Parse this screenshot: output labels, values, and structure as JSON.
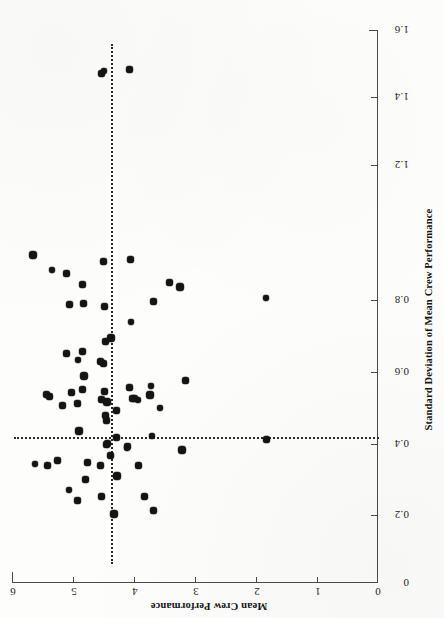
{
  "figure": {
    "orientation": "rotated-90-ccw-scan",
    "background_color": "#fdfdfc",
    "marker_color": "#141414",
    "axis_color": "#4a4a4a",
    "refline_color": "#2a2a2a"
  },
  "chart_data": {
    "type": "scatter",
    "title": "",
    "xlabel": "Standard Deviation of Mean Crew Performance",
    "ylabel": "Mean Crew Performance",
    "xlim": [
      0,
      1.6
    ],
    "ylim": [
      0,
      6
    ],
    "xticks": [
      0,
      0.2,
      0.4,
      0.6,
      0.8,
      1.2,
      1.4,
      1.6
    ],
    "xtick_labels": [
      "0",
      "0.2",
      "0.4",
      "0.6",
      "0.8",
      "1.2",
      "1.4",
      "1.6"
    ],
    "yticks": [
      0,
      1,
      2,
      3,
      4,
      5,
      6
    ],
    "ytick_labels": [
      "0",
      "1",
      "2",
      "3",
      "4",
      "5",
      "6"
    ],
    "grid": false,
    "legend": null,
    "reference_lines": [
      {
        "axis": "x",
        "orientation": "vertical-in-plot",
        "value": 0.415,
        "style": "dotted",
        "label": ""
      },
      {
        "axis": "y",
        "orientation": "horizontal-in-plot",
        "value": 4.5,
        "style": "dotted",
        "label": ""
      }
    ],
    "n_points": 69,
    "points": [
      {
        "x": 0.2,
        "y": 4.32
      },
      {
        "x": 0.21,
        "y": 3.68
      },
      {
        "x": 0.24,
        "y": 4.92
      },
      {
        "x": 0.25,
        "y": 4.53
      },
      {
        "x": 0.25,
        "y": 3.82
      },
      {
        "x": 0.27,
        "y": 5.07
      },
      {
        "x": 0.3,
        "y": 4.8
      },
      {
        "x": 0.31,
        "y": 4.28
      },
      {
        "x": 0.34,
        "y": 5.42
      },
      {
        "x": 0.34,
        "y": 3.93
      },
      {
        "x": 0.345,
        "y": 5.62
      },
      {
        "x": 0.35,
        "y": 4.77
      },
      {
        "x": 0.355,
        "y": 5.25
      },
      {
        "x": 0.37,
        "y": 4.38
      },
      {
        "x": 0.385,
        "y": 3.22
      },
      {
        "x": 0.39,
        "y": 4.12
      },
      {
        "x": 0.395,
        "y": 4.1
      },
      {
        "x": 0.4,
        "y": 4.45
      },
      {
        "x": 0.405,
        "y": 4.43
      },
      {
        "x": 0.415,
        "y": 1.82
      },
      {
        "x": 0.425,
        "y": 3.7
      },
      {
        "x": 0.44,
        "y": 4.9
      },
      {
        "x": 0.47,
        "y": 4.45
      },
      {
        "x": 0.485,
        "y": 4.47
      },
      {
        "x": 0.5,
        "y": 4.28
      },
      {
        "x": 0.505,
        "y": 3.58
      },
      {
        "x": 0.515,
        "y": 5.18
      },
      {
        "x": 0.52,
        "y": 4.92
      },
      {
        "x": 0.525,
        "y": 4.45
      },
      {
        "x": 0.53,
        "y": 4.53
      },
      {
        "x": 0.53,
        "y": 3.94
      },
      {
        "x": 0.535,
        "y": 4.0
      },
      {
        "x": 0.535,
        "y": 4.02
      },
      {
        "x": 0.54,
        "y": 5.38
      },
      {
        "x": 0.545,
        "y": 5.44
      },
      {
        "x": 0.545,
        "y": 3.74
      },
      {
        "x": 0.55,
        "y": 5.03
      },
      {
        "x": 0.555,
        "y": 4.48
      },
      {
        "x": 0.56,
        "y": 4.85
      },
      {
        "x": 0.565,
        "y": 4.07
      },
      {
        "x": 0.57,
        "y": 3.72
      },
      {
        "x": 0.585,
        "y": 3.16
      },
      {
        "x": 0.6,
        "y": 4.82
      },
      {
        "x": 0.635,
        "y": 4.5
      },
      {
        "x": 0.64,
        "y": 4.55
      },
      {
        "x": 0.645,
        "y": 4.92
      },
      {
        "x": 0.665,
        "y": 5.1
      },
      {
        "x": 0.67,
        "y": 4.84
      },
      {
        "x": 0.7,
        "y": 4.47
      },
      {
        "x": 0.71,
        "y": 4.38
      },
      {
        "x": 0.755,
        "y": 4.05
      },
      {
        "x": 0.8,
        "y": 4.48
      },
      {
        "x": 0.805,
        "y": 5.05
      },
      {
        "x": 0.81,
        "y": 4.82
      },
      {
        "x": 0.815,
        "y": 3.68
      },
      {
        "x": 0.825,
        "y": 1.84
      },
      {
        "x": 0.855,
        "y": 3.25
      },
      {
        "x": 0.865,
        "y": 4.85
      },
      {
        "x": 0.87,
        "y": 3.42
      },
      {
        "x": 0.895,
        "y": 5.1
      },
      {
        "x": 0.905,
        "y": 5.35
      },
      {
        "x": 0.93,
        "y": 4.5
      },
      {
        "x": 0.935,
        "y": 4.05
      },
      {
        "x": 0.95,
        "y": 5.65
      },
      {
        "x": 1.475,
        "y": 4.53
      },
      {
        "x": 1.48,
        "y": 4.5
      },
      {
        "x": 1.485,
        "y": 4.08
      },
      {
        "x": 0.42,
        "y": 4.28
      },
      {
        "x": 0.34,
        "y": 4.55
      }
    ]
  },
  "axes": {
    "x_axis": {
      "name": "Standard Deviation of Mean Crew Performance",
      "position": "right-vertical"
    },
    "y_axis": {
      "name": "Mean Crew Performance",
      "position": "bottom-horizontal"
    }
  }
}
